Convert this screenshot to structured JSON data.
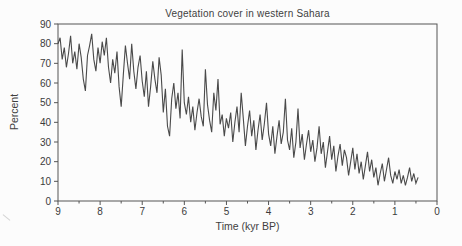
{
  "title": "Vegetation cover in western Sahara",
  "colors": {
    "line": "#4a4a4a",
    "axis": "#555555",
    "tick_text": "#3b3b3b",
    "background": "#fcfcfc"
  },
  "chart_data": {
    "type": "line",
    "title": "Vegetation cover in western Sahara",
    "xlabel": "Time (kyr BP)",
    "ylabel": "Percent",
    "grid": false,
    "legend": "none",
    "frame": "full-box",
    "x_axis": {
      "min": 0,
      "max": 9,
      "reversed": true,
      "major_ticks": [
        9,
        8,
        7,
        6,
        5,
        4,
        3,
        2,
        1,
        0
      ],
      "minor_tick_interval": 0.5
    },
    "y_axis": {
      "min": 0,
      "max": 90,
      "major_ticks": [
        0,
        10,
        20,
        30,
        40,
        50,
        60,
        70,
        80,
        90
      ]
    },
    "series": [
      {
        "name": "vegetation-cover-percent",
        "x_start": 9.0,
        "x_step": -0.05,
        "x_end": 0.45,
        "values": [
          80,
          83,
          72,
          78,
          68,
          75,
          84,
          70,
          76,
          67,
          80,
          73,
          62,
          56,
          74,
          79,
          85,
          72,
          66,
          78,
          70,
          81,
          74,
          83,
          68,
          60,
          72,
          65,
          76,
          58,
          48,
          64,
          79,
          70,
          62,
          80,
          66,
          57,
          68,
          74,
          61,
          53,
          66,
          48,
          58,
          71,
          62,
          55,
          73,
          64,
          45,
          57,
          38,
          33,
          52,
          60,
          47,
          55,
          42,
          77,
          50,
          44,
          53,
          40,
          48,
          36,
          45,
          52,
          43,
          38,
          67,
          49,
          41,
          35,
          55,
          46,
          62,
          39,
          44,
          33,
          42,
          37,
          45,
          30,
          40,
          48,
          35,
          55,
          42,
          28,
          38,
          46,
          33,
          41,
          26,
          36,
          44,
          31,
          39,
          50,
          34,
          28,
          38,
          24,
          33,
          41,
          29,
          35,
          52,
          31,
          26,
          37,
          22,
          30,
          47,
          27,
          34,
          21,
          29,
          36,
          25,
          31,
          20,
          27,
          38,
          24,
          30,
          17,
          25,
          33,
          21,
          28,
          15,
          23,
          29,
          18,
          26,
          22,
          13,
          20,
          27,
          16,
          24,
          14,
          20,
          11,
          18,
          25,
          15,
          21,
          12,
          17,
          8,
          14,
          19,
          10,
          16,
          22,
          13,
          9,
          15,
          11,
          16,
          9,
          13,
          8,
          12,
          17,
          10,
          14,
          9,
          12
        ]
      }
    ]
  }
}
